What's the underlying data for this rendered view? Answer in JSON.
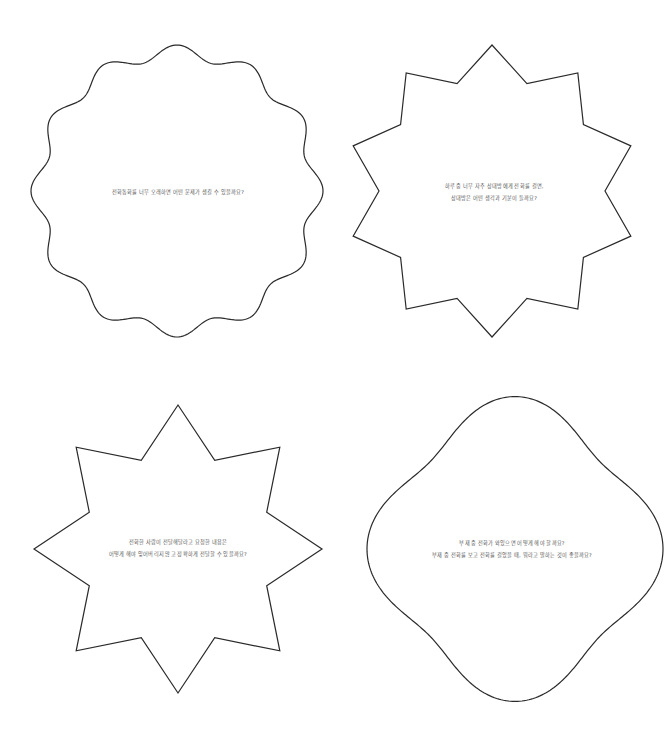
{
  "colors": {
    "stroke": "#2a2a2a",
    "text": "#555555",
    "background": "#ffffff"
  },
  "cards": [
    {
      "shape": "wavy-circle",
      "lines": [
        "전화통화를 너무 오래하면 어떤 문제가 생길 수 있을까요?"
      ]
    },
    {
      "shape": "ten-point-star",
      "lines": [
        "하루 중 너무 자주 상대방에게 전화를 걸면,",
        "상대방은 어떤 생각과 기분이 들까요?"
      ]
    },
    {
      "shape": "eight-point-star",
      "lines": [
        "전화한 사람이 전달해달라고 요청한 내용은",
        "어떻게 해야 잊어버리지 않고 정확하게 전달할 수 있을까요?"
      ]
    },
    {
      "shape": "four-lobe-blob",
      "lines": [
        "부재 중 전화가 와있으면 어떻게 해야 할까요?",
        "부재 중 전화를 보고 전화를 걸었을 때, 뭐라고 말하는 것이 좋을까요?"
      ]
    }
  ]
}
